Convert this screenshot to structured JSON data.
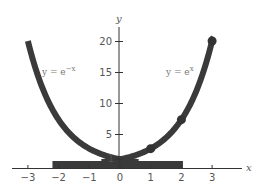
{
  "chart_data": {
    "type": "line",
    "title": "",
    "xlabel": "x",
    "ylabel": "y",
    "xlim": [
      -3.3,
      4
    ],
    "ylim": [
      0,
      22
    ],
    "grid": false,
    "legend": "inline labels",
    "x_ticks": [
      -3,
      -2,
      -1,
      0,
      1,
      2,
      3
    ],
    "x_tick_labels": [
      "−3",
      "−2",
      "−1",
      "0",
      "1",
      "2",
      "3"
    ],
    "y_ticks": [
      1,
      5,
      10,
      15,
      20
    ],
    "y_tick_labels": [
      "1",
      "5",
      "10",
      "15",
      "20"
    ],
    "series": [
      {
        "name": "y = e^-x",
        "label": "y = e",
        "label_exp": "−x",
        "x": [
          -3,
          -2.5,
          -2,
          -1.5,
          -1,
          -0.5,
          0,
          0.5,
          1,
          1.5,
          2
        ],
        "values": [
          20.09,
          12.18,
          7.39,
          4.48,
          2.72,
          1.65,
          1.0,
          0.61,
          0.37,
          0.22,
          0.14
        ],
        "color": "#3a3a3a"
      },
      {
        "name": "y = e^x",
        "label": "y = e",
        "label_exp": "x",
        "x": [
          -2,
          -1.5,
          -1,
          -0.5,
          0,
          0.5,
          1,
          1.5,
          2,
          2.5,
          3
        ],
        "values": [
          0.14,
          0.22,
          0.37,
          0.61,
          1.0,
          1.65,
          2.72,
          4.48,
          7.39,
          12.18,
          20.09
        ],
        "markers_at": [
          1,
          2,
          3
        ],
        "color": "#3a3a3a"
      }
    ]
  }
}
